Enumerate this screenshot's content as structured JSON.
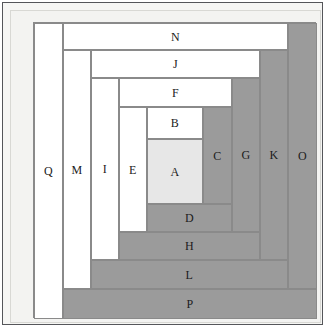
{
  "figure": {
    "type": "log-cabin-quilt-block-diagram",
    "colors": {
      "center_fill": "#e7e7e7",
      "light_fill": "#ffffff",
      "dark_fill": "#9b9b9b",
      "stroke": "#8a8a8a",
      "frame_border": "#55565a",
      "mat_background": "#f3f3f1",
      "label_color": "#1b1b1b"
    },
    "canvas": {
      "width": 283,
      "height": 296
    },
    "patches": [
      {
        "label": "A",
        "shade": "mid",
        "x": 113,
        "y": 116,
        "w": 56,
        "h": 65
      },
      {
        "label": "B",
        "shade": "light",
        "x": 113,
        "y": 84,
        "w": 56,
        "h": 32
      },
      {
        "label": "C",
        "shade": "dark",
        "x": 169,
        "y": 84,
        "w": 29,
        "h": 97
      },
      {
        "label": "D",
        "shade": "dark",
        "x": 113,
        "y": 181,
        "w": 85,
        "h": 28
      },
      {
        "label": "E",
        "shade": "light",
        "x": 85,
        "y": 84,
        "w": 28,
        "h": 125
      },
      {
        "label": "F",
        "shade": "light",
        "x": 85,
        "y": 55,
        "w": 113,
        "h": 29
      },
      {
        "label": "G",
        "shade": "dark",
        "x": 198,
        "y": 55,
        "w": 28,
        "h": 154
      },
      {
        "label": "H",
        "shade": "dark",
        "x": 85,
        "y": 209,
        "w": 141,
        "h": 28
      },
      {
        "label": "I",
        "shade": "light",
        "x": 57,
        "y": 55,
        "w": 28,
        "h": 182
      },
      {
        "label": "J",
        "shade": "light",
        "x": 57,
        "y": 27,
        "w": 169,
        "h": 28
      },
      {
        "label": "K",
        "shade": "dark",
        "x": 226,
        "y": 27,
        "w": 28,
        "h": 210
      },
      {
        "label": "L",
        "shade": "dark",
        "x": 57,
        "y": 237,
        "w": 197,
        "h": 29
      },
      {
        "label": "M",
        "shade": "light",
        "x": 29,
        "y": 27,
        "w": 28,
        "h": 239
      },
      {
        "label": "N",
        "shade": "light",
        "x": 29,
        "y": 0,
        "w": 225,
        "h": 27
      },
      {
        "label": "O",
        "shade": "dark",
        "x": 254,
        "y": 0,
        "w": 29,
        "h": 266
      },
      {
        "label": "P",
        "shade": "dark",
        "x": 29,
        "y": 266,
        "w": 254,
        "h": 30
      },
      {
        "label": "Q",
        "shade": "light",
        "x": 0,
        "y": 0,
        "w": 29,
        "h": 296
      }
    ]
  }
}
